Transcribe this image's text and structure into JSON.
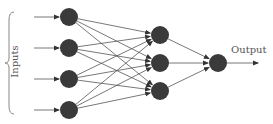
{
  "diagram": {
    "type": "feedforward-neural-network",
    "inputs_label": "Inputs",
    "output_label": "Output",
    "layers": [
      {
        "name": "input",
        "nodes": [
          {
            "x": 69,
            "y": 17
          },
          {
            "x": 69,
            "y": 48
          },
          {
            "x": 69,
            "y": 79
          },
          {
            "x": 69,
            "y": 110
          }
        ]
      },
      {
        "name": "hidden",
        "nodes": [
          {
            "x": 160,
            "y": 35
          },
          {
            "x": 160,
            "y": 63
          },
          {
            "x": 160,
            "y": 91
          }
        ]
      },
      {
        "name": "output",
        "nodes": [
          {
            "x": 218,
            "y": 63
          }
        ]
      }
    ],
    "node_radius": 9,
    "node_color": "#3a3a3a",
    "edge_color": "#555555"
  }
}
